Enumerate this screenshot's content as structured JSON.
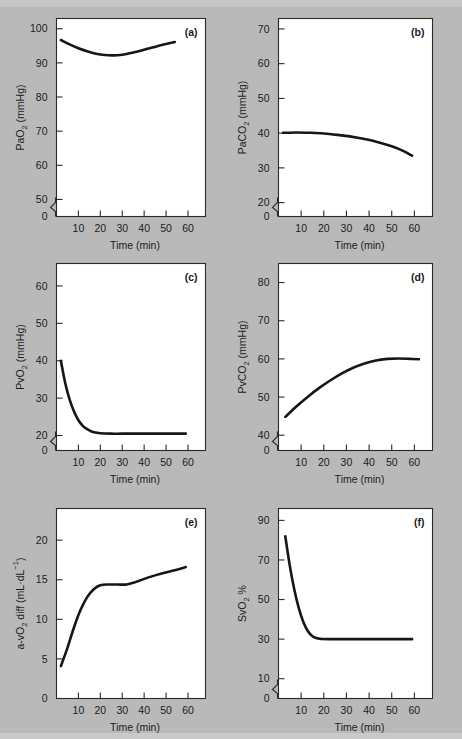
{
  "figure": {
    "background_color": "#b9b9b9",
    "plot_background_color": "#ffffff",
    "curve_color": "#161616",
    "axis_color": "#2a2a2a",
    "shared_xlabel": "Time (min)",
    "shared_xticks": [
      10,
      20,
      30,
      40,
      50,
      60
    ],
    "panel_count": 6
  },
  "chart_data": [
    {
      "type": "line",
      "panel": "(a)",
      "title": "",
      "xlabel": "Time (min)",
      "ylabel": "PaO2 (mmHg)",
      "ylabel_parts": {
        "pre": "PaO",
        "sub": "2",
        "post": " (mmHg)"
      },
      "xlim": [
        0,
        68
      ],
      "ylim": [
        45,
        103
      ],
      "xticks": [
        10,
        20,
        30,
        40,
        50,
        60
      ],
      "yticks": [
        50,
        60,
        70,
        80,
        90,
        100
      ],
      "y_axis_break": true,
      "y_break_label": "0",
      "grid": false,
      "legend": "none",
      "x": [
        2,
        6,
        10,
        14,
        18,
        22,
        26,
        30,
        34,
        38,
        42,
        46,
        50,
        54
      ],
      "y": [
        96.7,
        95.4,
        94.3,
        93.4,
        92.7,
        92.3,
        92.2,
        92.4,
        92.9,
        93.5,
        94.2,
        94.9,
        95.5,
        96.1
      ]
    },
    {
      "type": "line",
      "panel": "(b)",
      "title": "",
      "xlabel": "Time (min)",
      "ylabel": "PaCO2 (mmHg)",
      "ylabel_parts": {
        "pre": "PaCO",
        "sub": "2",
        "post": " (mmHg)"
      },
      "xlim": [
        0,
        68
      ],
      "ylim": [
        16,
        73
      ],
      "xticks": [
        10,
        20,
        30,
        40,
        50,
        60
      ],
      "yticks": [
        20,
        30,
        40,
        50,
        60,
        70
      ],
      "y_axis_break": true,
      "y_break_label": "0",
      "grid": false,
      "legend": "none",
      "x": [
        2,
        8,
        14,
        20,
        26,
        32,
        38,
        44,
        50,
        55,
        59
      ],
      "y": [
        40.1,
        40.2,
        40.1,
        39.9,
        39.5,
        39.0,
        38.3,
        37.4,
        36.2,
        34.9,
        33.5
      ]
    },
    {
      "type": "line",
      "panel": "(c)",
      "title": "",
      "xlabel": "Time (min)",
      "ylabel": "PvO2 (mmHg)",
      "ylabel_parts": {
        "pre": "PvO",
        "sub": "2",
        "post": " (mmHg)"
      },
      "xlim": [
        0,
        68
      ],
      "ylim": [
        16,
        66
      ],
      "xticks": [
        10,
        20,
        30,
        40,
        50,
        60
      ],
      "yticks": [
        20,
        30,
        40,
        50,
        60
      ],
      "y_axis_break": true,
      "y_break_label": "0",
      "grid": false,
      "legend": "none",
      "x": [
        2,
        4,
        6,
        8,
        10,
        12,
        14,
        16,
        18,
        20,
        25,
        30,
        40,
        50,
        59
      ],
      "y": [
        40.0,
        34.0,
        29.6,
        26.4,
        24.1,
        22.6,
        21.7,
        21.1,
        20.8,
        20.6,
        20.5,
        20.5,
        20.5,
        20.5,
        20.5
      ]
    },
    {
      "type": "line",
      "panel": "(d)",
      "title": "",
      "xlabel": "Time (min)",
      "ylabel": "PvCO2 (mmHg)",
      "ylabel_parts": {
        "pre": "PvCO",
        "sub": "2",
        "post": " (mmHg)"
      },
      "xlim": [
        0,
        68
      ],
      "ylim": [
        36,
        85
      ],
      "xticks": [
        10,
        20,
        30,
        40,
        50,
        60
      ],
      "yticks": [
        40,
        50,
        60,
        70,
        80
      ],
      "y_axis_break": true,
      "y_break_label": "0",
      "grid": false,
      "legend": "none",
      "x": [
        3,
        8,
        13,
        18,
        23,
        28,
        33,
        38,
        43,
        48,
        53,
        58,
        62
      ],
      "y": [
        44.8,
        47.6,
        50.1,
        52.4,
        54.4,
        56.2,
        57.7,
        58.8,
        59.6,
        60.0,
        60.1,
        60.0,
        59.9
      ]
    },
    {
      "type": "line",
      "panel": "(e)",
      "title": "",
      "xlabel": "Time (min)",
      "ylabel": "a-vO2 diff (mL·dL-1)",
      "ylabel_parts": {
        "pre": "a-vO",
        "sub": "2",
        "mid": " diff (mL·dL",
        "sup": "−1",
        "post": ")"
      },
      "xlim": [
        0,
        68
      ],
      "ylim": [
        0,
        24
      ],
      "xticks": [
        10,
        20,
        30,
        40,
        50,
        60
      ],
      "yticks": [
        5,
        10,
        15,
        20
      ],
      "y_axis_break": false,
      "y_break_label": "0",
      "grid": false,
      "legend": "none",
      "x": [
        2,
        5,
        8,
        11,
        14,
        17,
        20,
        24,
        28,
        32,
        36,
        42,
        48,
        54,
        59
      ],
      "y": [
        4.1,
        6.4,
        9.0,
        11.2,
        12.8,
        13.8,
        14.3,
        14.4,
        14.4,
        14.4,
        14.7,
        15.3,
        15.8,
        16.2,
        16.6
      ]
    },
    {
      "type": "line",
      "panel": "(f)",
      "title": "",
      "xlabel": "Time (min)",
      "ylabel": "SvO2 %",
      "ylabel_parts": {
        "pre": "SvO",
        "sub": "2",
        "post": " %"
      },
      "xlim": [
        0,
        68
      ],
      "ylim": [
        0,
        96
      ],
      "xticks": [
        10,
        20,
        30,
        40,
        50,
        60
      ],
      "yticks": [
        10,
        30,
        50,
        70,
        90
      ],
      "y_axis_break": true,
      "y_break_label": "0",
      "grid": false,
      "legend": "none",
      "x": [
        3,
        5,
        7,
        9,
        11,
        13,
        15,
        17,
        19,
        25,
        32,
        40,
        50,
        59
      ],
      "y": [
        82.0,
        67.0,
        55.0,
        45.5,
        38.5,
        34.0,
        31.5,
        30.4,
        30.1,
        30.0,
        30.0,
        30.0,
        30.0,
        30.0
      ]
    }
  ]
}
